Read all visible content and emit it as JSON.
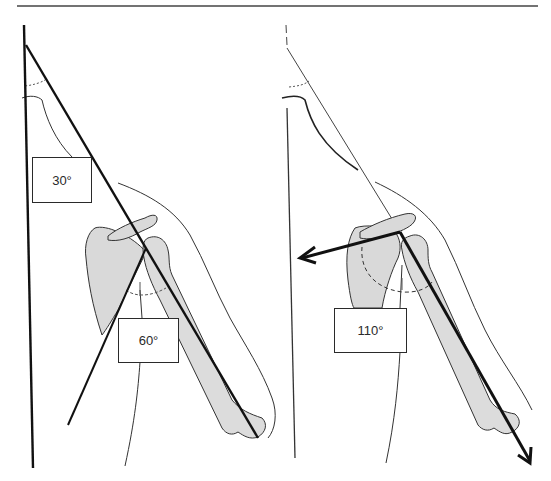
{
  "figure": {
    "panels": [
      {
        "id": "left",
        "labels": [
          {
            "text": "30°",
            "meaning": "scapular upward rotation"
          },
          {
            "text": "60°",
            "meaning": "glenohumeral angle"
          }
        ]
      },
      {
        "id": "right",
        "labels": [
          {
            "text": "110°",
            "meaning": "angle between scapular spine and humerus"
          }
        ]
      }
    ]
  },
  "labels": {
    "left_30": "30°",
    "left_60": "60°",
    "right_110": "110°"
  },
  "colors": {
    "line": "#111111",
    "outline": "#333333",
    "bone_fill": "#d9d9d9",
    "background": "#ffffff"
  }
}
